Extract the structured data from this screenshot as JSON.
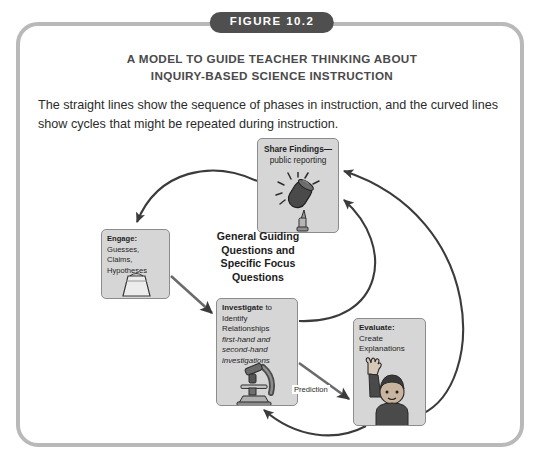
{
  "figure": {
    "badge_label": "FIGURE 10.2",
    "title_line1": "A MODEL TO GUIDE TEACHER THINKING ABOUT",
    "title_line2": "INQUIRY-BASED SCIENCE INSTRUCTION",
    "caption": "The straight lines show the sequence of phases in instruction, and the curved lines show cycles that might be repeated during instruction."
  },
  "diagram": {
    "center_label_line1": "General Guiding",
    "center_label_line2": "Questions and",
    "center_label_line3": "Specific Focus",
    "center_label_line4": "Questions",
    "nodes": {
      "share": {
        "title": "Share Findings—",
        "subtitle": "public reporting",
        "icon": "microphone-icon"
      },
      "engage": {
        "title": "Engage:",
        "line1": "Guesses, Claims,",
        "line2": "Hypotheses",
        "icon": "bell-jar-icon"
      },
      "investigate": {
        "title": "Investigate",
        "title_tail": " to",
        "line1": "Identify",
        "line2": "Relationships",
        "italic1": "first-hand and",
        "italic2": "second-hand",
        "italic3": "investigations",
        "icon": "microscope-icon"
      },
      "evaluate": {
        "title": "Evaluate:",
        "line1": "Create",
        "line2": "Explanations",
        "icon": "person-raising-hand-icon"
      }
    },
    "edges": {
      "prediction_label": "Prediction"
    }
  },
  "colors": {
    "frame_border": "#b9b9b9",
    "badge_background": "#4f4f4f",
    "badge_text": "#ffffff",
    "title_text": "#4a4a4a",
    "node_fill": "#d6d6d6",
    "node_border": "#8c8c8c",
    "arrow": "#3b3b3b",
    "page_background": "#ffffff"
  }
}
